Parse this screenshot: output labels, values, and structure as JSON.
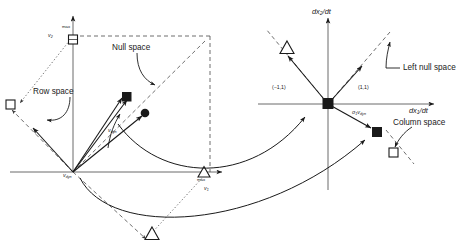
{
  "figure": {
    "stroke_color": "#1a1a1a",
    "dash_color": "#4a4a4a",
    "background": "#ffffff"
  },
  "left_panel": {
    "name": "domain-plane",
    "axis_horizontal_label": "v1",
    "axis_horizontal_sub": "1",
    "axis_horizontal_base": "v",
    "axis_vertical_base": "v",
    "axis_vertical_sub": "2",
    "origin_label_base": "v",
    "origin_label_sub": "dyn",
    "vector_label_base": "v",
    "vector_label_sub": "dyn",
    "max_label_top": "max",
    "max_label_right": "max",
    "annotations": [
      {
        "id": "row-space",
        "text": "Row space"
      },
      {
        "id": "null-space",
        "text": "Null space"
      }
    ]
  },
  "right_panel": {
    "name": "range-plane",
    "axis_horizontal_label": "dx1/dt",
    "axis_horizontal_pre": "dx",
    "axis_horizontal_sub": "1",
    "axis_horizontal_post": "/dt",
    "axis_vertical_pre": "dx",
    "axis_vertical_sub": "2",
    "axis_vertical_post": "/dt",
    "coord_left": "(−1,1)",
    "coord_right": "(1,1)",
    "sigma_label_pre": "σ",
    "sigma_label_sub1": "1",
    "sigma_label_v": "v",
    "sigma_label_sub2": "dyn",
    "annotations": [
      {
        "id": "left-null-space",
        "text": "Left null space"
      },
      {
        "id": "column-space",
        "text": "Column space"
      }
    ]
  },
  "markers": {
    "filled_square": "filled-square-marker",
    "open_square": "open-square-marker",
    "filled_circle": "filled-circle-marker",
    "open_triangle": "open-triangle-marker"
  }
}
